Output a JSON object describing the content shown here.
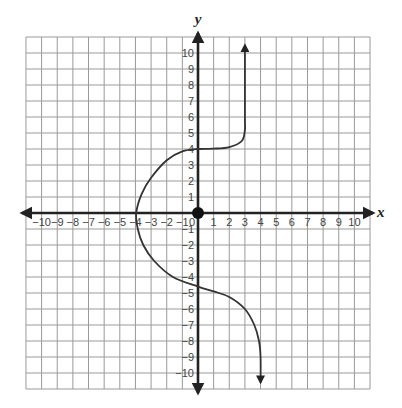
{
  "chart_data": {
    "type": "line",
    "title": "",
    "xlabel": "x",
    "ylabel": "y",
    "xlim": [
      -11,
      11
    ],
    "ylim": [
      -11,
      11
    ],
    "grid": true,
    "x_ticks": [
      -10,
      -9,
      -8,
      -7,
      -6,
      -5,
      -4,
      -3,
      -2,
      -1,
      0,
      1,
      2,
      3,
      4,
      5,
      6,
      7,
      8,
      9,
      10
    ],
    "y_ticks": [
      -10,
      -9,
      -8,
      -7,
      -6,
      -5,
      -4,
      -3,
      -2,
      -1,
      1,
      2,
      3,
      4,
      5,
      6,
      7,
      8,
      9,
      10
    ],
    "origin_point": {
      "x": 0,
      "y": 0,
      "marker": "filled-circle"
    },
    "series": [
      {
        "name": "curve",
        "arrow_start": true,
        "arrow_end": true,
        "points": [
          [
            3,
            10.5
          ],
          [
            3,
            6
          ],
          [
            3,
            5.2
          ],
          [
            2.8,
            4.5
          ],
          [
            2,
            4.12
          ],
          [
            1,
            4.02
          ],
          [
            0,
            4.0
          ],
          [
            -1,
            3.85
          ],
          [
            -2,
            3.3
          ],
          [
            -3,
            2.2
          ],
          [
            -3.6,
            1.2
          ],
          [
            -3.95,
            0
          ],
          [
            -3.85,
            -1
          ],
          [
            -3.5,
            -2
          ],
          [
            -2.8,
            -3
          ],
          [
            -1.6,
            -4
          ],
          [
            0,
            -4.6
          ],
          [
            1,
            -4.9
          ],
          [
            2,
            -5.25
          ],
          [
            3,
            -6
          ],
          [
            3.6,
            -7
          ],
          [
            3.9,
            -8
          ],
          [
            4,
            -9
          ],
          [
            4,
            -10.6
          ]
        ]
      }
    ]
  },
  "labels": {
    "x_axis": "x",
    "y_axis": "y"
  },
  "style": {
    "grid_color": "#9a9a9a",
    "axis_color": "#222222",
    "curve_color": "#333333"
  }
}
